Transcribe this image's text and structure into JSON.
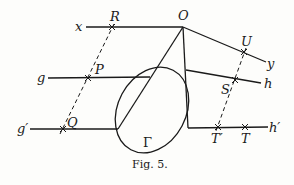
{
  "figure": {
    "caption": "Fig. 5.",
    "curve_label": "Γ",
    "labels": {
      "x": "x",
      "O": "O",
      "R": "R",
      "y": "y",
      "U": "U",
      "g": "g",
      "P": "P",
      "h": "h",
      "S": "S",
      "g_prime": "g′",
      "Q": "Q",
      "h_prime": "h′",
      "T_prime": "T′",
      "T": "T"
    },
    "colors": {
      "ink": "#1a1a1a",
      "paper": "#fdfdfb"
    }
  }
}
